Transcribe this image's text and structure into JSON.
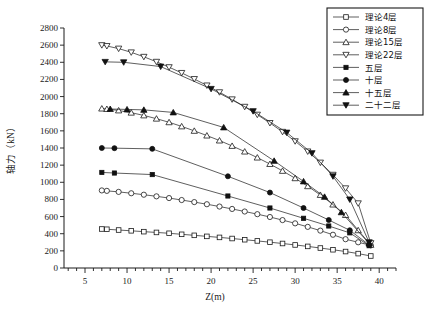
{
  "chart_data": {
    "type": "line",
    "title": "",
    "xlabel": "Z(m)",
    "ylabel": "轴力（kN）",
    "xlim": [
      2.5,
      42
    ],
    "ylim": [
      0,
      2800
    ],
    "xticks": [
      5,
      10,
      15,
      20,
      25,
      30,
      35,
      40
    ],
    "yticks": [
      0,
      200,
      400,
      600,
      800,
      1000,
      1200,
      1400,
      1600,
      1800,
      2000,
      2200,
      2400,
      2600,
      2800
    ],
    "grid": false,
    "legend_position": "top-right",
    "series": [
      {
        "name": "理论4层",
        "marker": "open-square",
        "points": [
          [
            7.0,
            455
          ],
          [
            7.6,
            452
          ],
          [
            9.0,
            443
          ],
          [
            10.5,
            434
          ],
          [
            12.0,
            424
          ],
          [
            13.5,
            415
          ],
          [
            15.0,
            405
          ],
          [
            16.5,
            393
          ],
          [
            18.0,
            381
          ],
          [
            19.5,
            369
          ],
          [
            21.0,
            357
          ],
          [
            22.5,
            344
          ],
          [
            24.0,
            330
          ],
          [
            25.5,
            316
          ],
          [
            27.0,
            301
          ],
          [
            28.5,
            286
          ],
          [
            30.0,
            269
          ],
          [
            31.5,
            252
          ],
          [
            33.0,
            233
          ],
          [
            34.5,
            213
          ],
          [
            36.0,
            192
          ],
          [
            37.5,
            168
          ],
          [
            39.0,
            140
          ]
        ]
      },
      {
        "name": "理论8层",
        "marker": "open-circle",
        "points": [
          [
            7.0,
            905
          ],
          [
            7.6,
            900
          ],
          [
            9.0,
            888
          ],
          [
            10.5,
            872
          ],
          [
            12.0,
            855
          ],
          [
            13.5,
            836
          ],
          [
            15.0,
            816
          ],
          [
            16.5,
            793
          ],
          [
            18.0,
            769
          ],
          [
            19.5,
            744
          ],
          [
            21.0,
            717
          ],
          [
            22.5,
            689
          ],
          [
            24.0,
            659
          ],
          [
            25.5,
            628
          ],
          [
            27.0,
            595
          ],
          [
            28.5,
            559
          ],
          [
            30.0,
            521
          ],
          [
            31.5,
            480
          ],
          [
            33.0,
            436
          ],
          [
            34.5,
            388
          ],
          [
            36.0,
            336
          ],
          [
            37.5,
            300
          ],
          [
            39.0,
            265
          ]
        ]
      },
      {
        "name": "理论15层",
        "marker": "open-triangle-up",
        "points": [
          [
            7.0,
            1860
          ],
          [
            7.6,
            1855
          ],
          [
            9.0,
            1838
          ],
          [
            10.5,
            1812
          ],
          [
            12.0,
            1780
          ],
          [
            13.5,
            1742
          ],
          [
            15.0,
            1700
          ],
          [
            16.5,
            1652
          ],
          [
            18.0,
            1600
          ],
          [
            19.5,
            1545
          ],
          [
            21.0,
            1487
          ],
          [
            22.5,
            1424
          ],
          [
            24.0,
            1358
          ],
          [
            25.5,
            1288
          ],
          [
            27.0,
            1213
          ],
          [
            28.5,
            1133
          ],
          [
            30.0,
            1047
          ],
          [
            31.5,
            954
          ],
          [
            33.0,
            852
          ],
          [
            34.5,
            740
          ],
          [
            36.0,
            618
          ],
          [
            37.5,
            440
          ],
          [
            39.0,
            270
          ]
        ]
      },
      {
        "name": "理论22层",
        "marker": "open-triangle-down",
        "points": [
          [
            7.0,
            2600
          ],
          [
            7.6,
            2590
          ],
          [
            9.0,
            2560
          ],
          [
            10.5,
            2516
          ],
          [
            12.0,
            2464
          ],
          [
            13.5,
            2406
          ],
          [
            15.0,
            2343
          ],
          [
            16.5,
            2276
          ],
          [
            18.0,
            2205
          ],
          [
            19.5,
            2130
          ],
          [
            21.0,
            2051
          ],
          [
            22.5,
            1968
          ],
          [
            24.0,
            1881
          ],
          [
            25.5,
            1789
          ],
          [
            27.0,
            1692
          ],
          [
            28.5,
            1589
          ],
          [
            30.0,
            1479
          ],
          [
            31.5,
            1360
          ],
          [
            33.0,
            1230
          ],
          [
            34.5,
            1088
          ],
          [
            36.0,
            930
          ],
          [
            37.5,
            755
          ],
          [
            39.0,
            290
          ]
        ]
      },
      {
        "name": "五层",
        "marker": "solid-square",
        "points": [
          [
            7.0,
            1115
          ],
          [
            8.5,
            1108
          ],
          [
            13.0,
            1090
          ],
          [
            22.0,
            840
          ],
          [
            27.0,
            700
          ],
          [
            31.0,
            580
          ],
          [
            34.0,
            490
          ],
          [
            36.5,
            410
          ],
          [
            38.8,
            260
          ]
        ]
      },
      {
        "name": "十层",
        "marker": "solid-circle",
        "points": [
          [
            7.0,
            1400
          ],
          [
            8.5,
            1398
          ],
          [
            13.0,
            1390
          ],
          [
            22.0,
            1070
          ],
          [
            27.0,
            880
          ],
          [
            31.0,
            700
          ],
          [
            34.0,
            560
          ],
          [
            36.5,
            440
          ],
          [
            38.8,
            270
          ]
        ]
      },
      {
        "name": "十五层",
        "marker": "solid-triangle-up",
        "points": [
          [
            8.0,
            1855
          ],
          [
            10.0,
            1850
          ],
          [
            12.0,
            1845
          ],
          [
            15.5,
            1815
          ],
          [
            21.5,
            1640
          ],
          [
            27.5,
            1250
          ],
          [
            31.0,
            1010
          ],
          [
            33.5,
            830
          ],
          [
            35.5,
            650
          ],
          [
            38.8,
            285
          ]
        ]
      },
      {
        "name": "二十二层",
        "marker": "solid-triangle-down",
        "points": [
          [
            7.4,
            2405
          ],
          [
            9.6,
            2400
          ],
          [
            14.0,
            2350
          ],
          [
            20.0,
            2090
          ],
          [
            25.0,
            1830
          ],
          [
            29.0,
            1580
          ],
          [
            32.0,
            1340
          ],
          [
            34.5,
            1070
          ],
          [
            36.5,
            800
          ],
          [
            38.8,
            300
          ]
        ]
      }
    ]
  },
  "legend": {
    "items": [
      {
        "label": "理论4层",
        "marker": "open-square"
      },
      {
        "label": "理论8层",
        "marker": "open-circle"
      },
      {
        "label": "理论15层",
        "marker": "open-triangle-up"
      },
      {
        "label": "理论22层",
        "marker": "open-triangle-down"
      },
      {
        "label": "五层",
        "marker": "solid-square"
      },
      {
        "label": "十层",
        "marker": "solid-circle"
      },
      {
        "label": "十五层",
        "marker": "solid-triangle-up"
      },
      {
        "label": "二十二层",
        "marker": "solid-triangle-down"
      }
    ]
  },
  "colors": {
    "line": "#1a1a1a",
    "text": "#111111",
    "background": "#ffffff"
  }
}
